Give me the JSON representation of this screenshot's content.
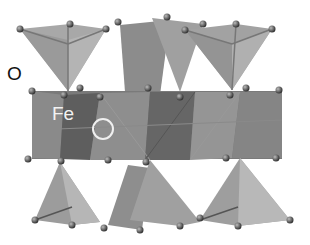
{
  "figure": {
    "type": "crystal-structure-polyhedra",
    "labels": {
      "oxygen": "O",
      "iron": "Fe"
    },
    "marked_site": "open circle (vacant/interstitial site)",
    "colors": {
      "background": "#ffffff",
      "tetrahedra": "#9a9a9a",
      "octahedral_layer": "#6e6e6e",
      "atom": "#555555",
      "label_dark": "#111111",
      "label_light": "#f2f2f2"
    }
  }
}
